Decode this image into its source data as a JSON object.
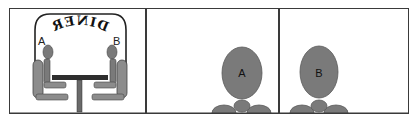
{
  "panels": [
    {
      "id": "panel-1",
      "sign_text": "DINER",
      "sign_mirrored": true,
      "labels": {
        "left": "A",
        "right": "B"
      }
    },
    {
      "id": "panel-2",
      "person_label": "A"
    },
    {
      "id": "panel-3",
      "person_label": "B"
    }
  ],
  "colors": {
    "frame": "#3a3a3a",
    "figure": "#7a7a7a",
    "figure_dark": "#555555",
    "chair": "#8c8c8c",
    "table": "#2e2e2e"
  }
}
